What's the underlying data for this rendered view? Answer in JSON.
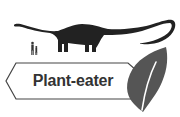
{
  "diagram": {
    "label": "Plant-eater",
    "elements": [
      {
        "type": "silhouette",
        "subject": "sauropod-dinosaur"
      },
      {
        "type": "silhouette",
        "subject": "two-humans-for-scale"
      },
      {
        "type": "arrow-label",
        "text": "Plant-eater"
      },
      {
        "type": "icon",
        "subject": "leaf"
      }
    ]
  },
  "colors": {
    "dinosaur": "#222222",
    "humans": "#333333",
    "label_border": "#444444",
    "label_text": "#333333",
    "leaf": "#555555",
    "background": "#ffffff"
  }
}
